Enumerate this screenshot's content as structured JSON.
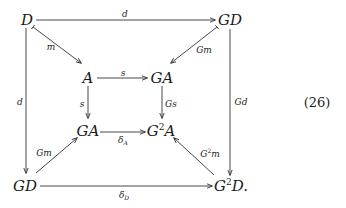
{
  "diagram": {
    "equation_number": "(26)",
    "nodes": {
      "D_top": {
        "base": "D",
        "sup": "",
        "suffix": ""
      },
      "GD_top": {
        "base": "GD",
        "sup": "",
        "suffix": ""
      },
      "A": {
        "base": "A",
        "sup": "",
        "suffix": ""
      },
      "GA_top": {
        "base": "GA",
        "sup": "",
        "suffix": ""
      },
      "GA_mid": {
        "base": "GA",
        "sup": "",
        "suffix": ""
      },
      "G2A": {
        "pre": "G",
        "sup": "2",
        "post": "A"
      },
      "GD_bottom": {
        "base": "GD",
        "sup": "",
        "suffix": ""
      },
      "G2D": {
        "pre": "G",
        "sup": "2",
        "post": "D."
      }
    },
    "arrows": [
      {
        "from": "D",
        "to": "GD",
        "label": "d"
      },
      {
        "from": "D",
        "to": "A",
        "label": "m"
      },
      {
        "from": "GD",
        "to": "GA",
        "label": "Gm"
      },
      {
        "from": "D",
        "to": "GD (bottom)",
        "label": "d"
      },
      {
        "from": "GD",
        "to": "G²D",
        "label": "Gd"
      },
      {
        "from": "A",
        "to": "GA",
        "label": "s"
      },
      {
        "from": "A",
        "to": "GA (mid)",
        "label": "s"
      },
      {
        "from": "GA",
        "to": "G²A",
        "label": "Gs"
      },
      {
        "from": "GA (mid)",
        "to": "G²A",
        "label": "δ",
        "sub": "A"
      },
      {
        "from": "GD (bottom)",
        "to": "GA (mid)",
        "label": "Gm"
      },
      {
        "from": "G²D",
        "to": "G²A",
        "label": "G",
        "sup": "2",
        "post": "m"
      },
      {
        "from": "GD (bottom)",
        "to": "G²D",
        "label": "δ",
        "sub": "D"
      }
    ]
  }
}
